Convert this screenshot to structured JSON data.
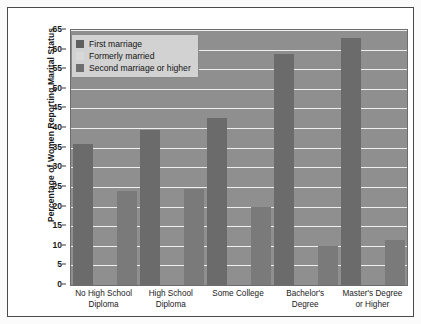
{
  "chart_data": {
    "type": "bar",
    "title": "",
    "xlabel": "",
    "ylabel": "Percentage of Women Reporting Marital Status",
    "ylim": [
      0,
      65
    ],
    "ytick_step": 5,
    "yticks": [
      0,
      5,
      10,
      15,
      20,
      25,
      30,
      35,
      40,
      45,
      50,
      55,
      60,
      65
    ],
    "grid": true,
    "legend_position": "top-left",
    "categories": [
      "No High School Diploma",
      "High School Diploma",
      "Some College",
      "Bachelor's Degree",
      "Master's Degree or Higher"
    ],
    "category_lines": [
      [
        "No High School",
        "Diploma"
      ],
      [
        "High School",
        "Diploma"
      ],
      [
        "Some College"
      ],
      [
        "Bachelor's",
        "Degree"
      ],
      [
        "Master's Degree",
        "or Higher"
      ]
    ],
    "series": [
      {
        "name": "First marriage",
        "color": "#6b6b6b",
        "values": [
          36,
          39.5,
          42.5,
          59,
          63
        ]
      },
      {
        "name": "Formerly married",
        "color": "#a0a0a0",
        "values": [
          0,
          0,
          0,
          0,
          0
        ]
      },
      {
        "name": "Second marriage or higher",
        "color": "#7a7a7a",
        "values": [
          24,
          24.5,
          20,
          10,
          11.5
        ]
      }
    ]
  },
  "legend": {
    "items": [
      {
        "label": "First marriage"
      },
      {
        "label": "Formerly married"
      },
      {
        "label": "Second marriage or higher"
      }
    ]
  }
}
